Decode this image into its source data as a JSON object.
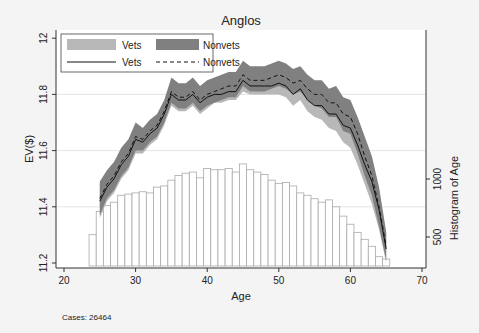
{
  "chart_data": {
    "type": "line",
    "title": "Anglos",
    "xlabel": "Age",
    "ylabel": "EV($)",
    "y2label": "Histogram of Age",
    "xlim": [
      20,
      70
    ],
    "ylim": [
      11.2,
      12.0
    ],
    "xticks": [
      20,
      30,
      40,
      50,
      60,
      70
    ],
    "yticks": [
      11.2,
      11.4,
      11.6,
      11.8,
      12
    ],
    "ytick_labels": [
      "11.2",
      "11.4",
      "11.6",
      "11.8",
      "12"
    ],
    "y2ticks": [
      500,
      1000
    ],
    "grid": true,
    "note": "Cases: 26464",
    "legend": {
      "position": "top-left inside",
      "entries": [
        {
          "label": "Vets",
          "type": "band",
          "color": "#b8b8b8"
        },
        {
          "label": "Nonvets",
          "type": "band",
          "color": "#808080"
        },
        {
          "label": "Vets",
          "type": "solid-line",
          "color": "#111111"
        },
        {
          "label": "Nonvets",
          "type": "dashed-line",
          "color": "#111111"
        }
      ]
    },
    "x": [
      25,
      26,
      27,
      28,
      29,
      30,
      31,
      32,
      33,
      34,
      35,
      36,
      37,
      38,
      39,
      40,
      41,
      42,
      43,
      44,
      45,
      46,
      47,
      48,
      49,
      50,
      51,
      52,
      53,
      54,
      55,
      56,
      57,
      58,
      59,
      60,
      61,
      62,
      63,
      64,
      65
    ],
    "series": [
      {
        "name": "Vets",
        "style": "solid",
        "values": [
          11.42,
          11.47,
          11.5,
          11.55,
          11.58,
          11.64,
          11.63,
          11.66,
          11.68,
          11.73,
          11.8,
          11.78,
          11.78,
          11.8,
          11.77,
          11.79,
          11.8,
          11.8,
          11.81,
          11.81,
          11.85,
          11.83,
          11.83,
          11.83,
          11.83,
          11.84,
          11.83,
          11.8,
          11.82,
          11.78,
          11.76,
          11.76,
          11.73,
          11.73,
          11.69,
          11.68,
          11.62,
          11.55,
          11.49,
          11.39,
          11.25
        ],
        "ci_low": [
          11.36,
          11.42,
          11.45,
          11.5,
          11.53,
          11.59,
          11.59,
          11.62,
          11.64,
          11.69,
          11.76,
          11.74,
          11.74,
          11.76,
          11.73,
          11.75,
          11.77,
          11.77,
          11.78,
          11.78,
          11.81,
          11.8,
          11.8,
          11.8,
          11.8,
          11.8,
          11.79,
          11.76,
          11.78,
          11.74,
          11.72,
          11.71,
          11.68,
          11.67,
          11.63,
          11.61,
          11.55,
          11.48,
          11.41,
          11.32,
          11.2
        ],
        "ci_high": [
          11.48,
          11.52,
          11.55,
          11.6,
          11.63,
          11.69,
          11.67,
          11.7,
          11.72,
          11.77,
          11.84,
          11.82,
          11.82,
          11.84,
          11.81,
          11.83,
          11.84,
          11.84,
          11.85,
          11.85,
          11.89,
          11.87,
          11.87,
          11.87,
          11.87,
          11.88,
          11.87,
          11.84,
          11.86,
          11.82,
          11.8,
          11.8,
          11.77,
          11.78,
          11.74,
          11.74,
          11.68,
          11.61,
          11.56,
          11.46,
          11.3
        ]
      },
      {
        "name": "Nonvets",
        "style": "dashed",
        "values": [
          11.43,
          11.48,
          11.51,
          11.56,
          11.59,
          11.65,
          11.64,
          11.67,
          11.69,
          11.74,
          11.81,
          11.79,
          11.79,
          11.81,
          11.78,
          11.8,
          11.81,
          11.82,
          11.83,
          11.83,
          11.87,
          11.85,
          11.85,
          11.85,
          11.86,
          11.87,
          11.86,
          11.84,
          11.85,
          11.82,
          11.8,
          11.8,
          11.77,
          11.77,
          11.73,
          11.72,
          11.66,
          11.58,
          11.51,
          11.4,
          11.26
        ],
        "ci_low": [
          11.37,
          11.43,
          11.46,
          11.51,
          11.54,
          11.6,
          11.6,
          11.63,
          11.65,
          11.7,
          11.77,
          11.75,
          11.75,
          11.77,
          11.74,
          11.76,
          11.77,
          11.78,
          11.79,
          11.79,
          11.83,
          11.81,
          11.81,
          11.81,
          11.82,
          11.83,
          11.82,
          11.8,
          11.81,
          11.78,
          11.76,
          11.75,
          11.72,
          11.72,
          11.67,
          11.66,
          11.59,
          11.51,
          11.44,
          11.33,
          11.21
        ],
        "ci_high": [
          11.49,
          11.53,
          11.56,
          11.61,
          11.64,
          11.7,
          11.68,
          11.71,
          11.73,
          11.78,
          11.86,
          11.84,
          11.84,
          11.86,
          11.83,
          11.85,
          11.86,
          11.87,
          11.88,
          11.88,
          11.92,
          11.9,
          11.9,
          11.9,
          11.91,
          11.92,
          11.91,
          11.89,
          11.9,
          11.87,
          11.85,
          11.85,
          11.82,
          11.83,
          11.79,
          11.78,
          11.72,
          11.65,
          11.58,
          11.47,
          11.31
        ]
      }
    ],
    "histogram": {
      "bin_start": 23.5,
      "bin_width": 1,
      "counts": [
        520,
        720,
        770,
        800,
        860,
        870,
        880,
        890,
        880,
        930,
        940,
        990,
        1030,
        1050,
        1060,
        1010,
        1090,
        1080,
        1080,
        1090,
        1060,
        1130,
        1080,
        1060,
        1040,
        990,
        960,
        970,
        940,
        880,
        860,
        830,
        800,
        820,
        760,
        680,
        610,
        540,
        480,
        420,
        330,
        310,
        220
      ]
    }
  }
}
